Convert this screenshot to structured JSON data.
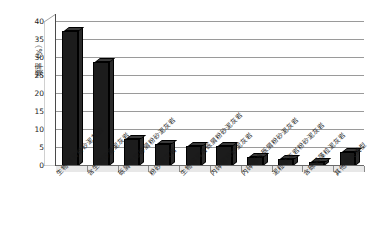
{
  "chart_data": {
    "type": "bar",
    "title": "",
    "subtitle": "",
    "xlabel": "",
    "ylabel": "频率（%）",
    "ylim": [
      0,
      40
    ],
    "ytick_step": 5,
    "yticks": [
      "0",
      "5",
      "10",
      "15",
      "20",
      "25",
      "30",
      "35",
      "40"
    ],
    "grid": true,
    "legend": false,
    "style": "3d-column",
    "bar_color": "#1c1c1c",
    "categories": [
      "生物碎屑粉砂泥灰岩",
      "含生物碎屑泥灰岩",
      "砾屑生物碎屑粉砂泥灰岩",
      "粉砂泥灰岩",
      "生物碎屑含砾屑粉砂泥灰岩",
      "内碎屑粉砂泥灰岩",
      "内碎屑含砾屑粉砂泥灰岩",
      "泥粒状灰岩粉砂泥灰岩",
      "含砾屑藻粒泥灰岩",
      "其他相关类型"
    ],
    "values": [
      37.5,
      29.0,
      7.5,
      6.0,
      5.5,
      5.5,
      2.5,
      2.0,
      1.0,
      4.0
    ]
  }
}
